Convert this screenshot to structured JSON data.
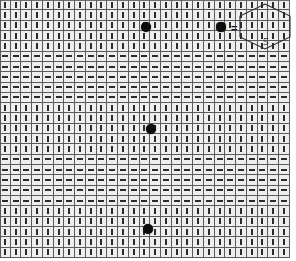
{
  "canvas": {
    "width": 296,
    "height": 261,
    "background": "#ffffff",
    "title": "Grid pattern with directional bar glyphs"
  },
  "grid": {
    "columns": 27,
    "rows": 25,
    "cell_width": 10.74,
    "cell_height": 10.32,
    "origin_x": 0,
    "origin_y": 0,
    "surface_color": "#eeeeec",
    "line_color": "#5a5a5a",
    "mark_color": "#2b2b2b",
    "band_pattern_note": "rows alternate in bands of five: vertical, horizontal, vertical, horizontal, vertical",
    "band_orientations": [
      "vertical",
      "vertical",
      "vertical",
      "vertical",
      "vertical",
      "horizontal",
      "horizontal",
      "horizontal",
      "horizontal",
      "horizontal",
      "vertical",
      "vertical",
      "vertical",
      "vertical",
      "vertical",
      "horizontal",
      "horizontal",
      "horizontal",
      "horizontal",
      "horizontal",
      "vertical",
      "vertical",
      "vertical",
      "vertical",
      "vertical"
    ]
  },
  "markers": {
    "color": "#0d0d0d",
    "shape": "filled-circle",
    "points": [
      {
        "id": "marker-1",
        "x": 146,
        "y": 27,
        "r": 5.0,
        "label": ""
      },
      {
        "id": "marker-2",
        "x": 221,
        "y": 27,
        "r": 4.6,
        "label": ""
      },
      {
        "id": "marker-3",
        "x": 151,
        "y": 129,
        "r": 5.0,
        "label": ""
      },
      {
        "id": "marker-4",
        "x": 148,
        "y": 229,
        "r": 5.0,
        "label": ""
      }
    ]
  },
  "annotations": {
    "equals_sign": {
      "text": "=",
      "x": 231,
      "y": 23
    },
    "hexagon": {
      "name": "hexagon-outline",
      "x": 238,
      "y": 3,
      "width": 54,
      "height": 47,
      "stroke": "#2a2a2a",
      "stroke_width": 1,
      "fill": "none"
    },
    "hexagon_label": {
      "text": "5",
      "x": 263,
      "y": 36
    }
  }
}
